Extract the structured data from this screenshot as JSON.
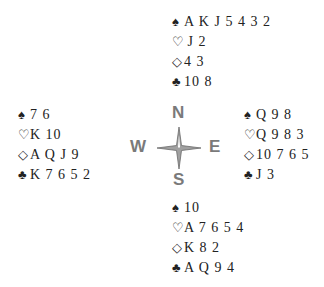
{
  "hands": {
    "north": {
      "spades": "A K J 5 4 3 2",
      "hearts": "J 2",
      "diamonds": "4 3",
      "clubs": "10 8"
    },
    "west": {
      "spades": "7 6",
      "hearts": "K 10",
      "diamonds": "A Q J 9",
      "clubs": "K 7 6 5 2"
    },
    "east": {
      "spades": "Q 9 8",
      "hearts": "Q 9 8 3",
      "diamonds": "10 7 6 5",
      "clubs": "J 3"
    },
    "south": {
      "spades": "10",
      "hearts": "A 7 6 5 4",
      "diamonds": "K 8 2",
      "clubs": "A Q 9 4"
    }
  },
  "suits": {
    "spades": "♠",
    "hearts": "♡",
    "diamonds": "◇",
    "clubs": "♣"
  },
  "compass": {
    "n": "N",
    "s": "S",
    "e": "E",
    "w": "W",
    "color": "#7a7a7a"
  }
}
